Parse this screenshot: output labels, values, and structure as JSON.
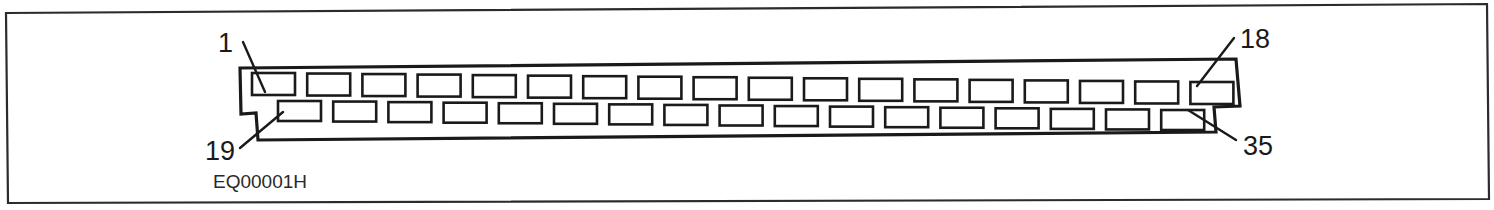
{
  "figure": {
    "caption": "EQ00001H",
    "frame": {
      "stroke_color": "#2b2b2b",
      "background": "#ffffff"
    },
    "drawing": {
      "type": "electrical-connector-header",
      "line_color": "#1a1a1a",
      "fill_color": "#ffffff",
      "tilt_note": "body slopes slightly downward from left to right"
    },
    "reference_numerals": [
      {
        "id": "ref-1",
        "label": "1",
        "position": "top-left",
        "text_x": 218,
        "text_y": 52,
        "leader": {
          "x1": 243,
          "y1": 42,
          "x2": 265,
          "y2": 92
        },
        "points_to": "first-top-slot"
      },
      {
        "id": "ref-18",
        "label": "18",
        "position": "top-right",
        "text_x": 1240,
        "text_y": 48,
        "leader": {
          "x1": 1234,
          "y1": 38,
          "x2": 1197,
          "y2": 86
        },
        "points_to": "last-top-slot"
      },
      {
        "id": "ref-19",
        "label": "19",
        "position": "bottom-left",
        "text_x": 205,
        "text_y": 160,
        "leader": {
          "x1": 240,
          "y1": 148,
          "x2": 283,
          "y2": 112
        },
        "points_to": "first-bottom-slot"
      },
      {
        "id": "ref-35",
        "label": "35",
        "position": "bottom-right",
        "text_x": 1243,
        "text_y": 155,
        "leader": {
          "x1": 1236,
          "y1": 140,
          "x2": 1188,
          "y2": 110
        },
        "points_to": "last-bottom-slot"
      }
    ],
    "slot_rows": {
      "top": {
        "count": 18,
        "start_x": 252,
        "pitch": 55.2,
        "slot_width": 43,
        "slot_height": 22,
        "start_y": 73,
        "y_drop": 9
      },
      "bottom": {
        "count": 17,
        "start_x": 278,
        "pitch": 55.2,
        "slot_width": 43,
        "slot_height": 20,
        "start_y": 101,
        "y_drop": 9
      }
    }
  }
}
